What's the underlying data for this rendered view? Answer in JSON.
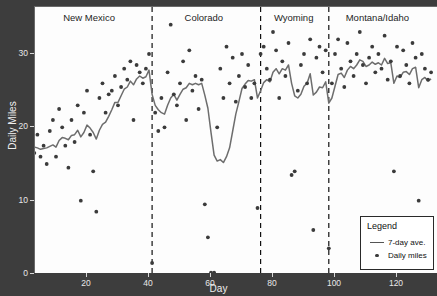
{
  "chart_data": {
    "type": "scatter",
    "title": "",
    "xlabel": "Day",
    "ylabel": "Daily Miles",
    "xlim": [
      1,
      131
    ],
    "ylim": [
      -1,
      35
    ],
    "xticks": [
      20,
      40,
      60,
      80,
      100,
      120
    ],
    "yticks": [
      0,
      10,
      20,
      30
    ],
    "grid": false,
    "legend": {
      "title": "Legend",
      "position": "bottom-right",
      "entries": [
        {
          "label": "7-day ave.",
          "symbol": "line",
          "color": "#555555"
        },
        {
          "label": "Daily miles",
          "symbol": "dot",
          "color": "#3b3b3b"
        }
      ]
    },
    "regions": [
      {
        "label": "New Mexico",
        "start": 1,
        "end": 41,
        "center_day": 21
      },
      {
        "label": "Colorado",
        "start": 41,
        "end": 76,
        "center_day": 58
      },
      {
        "label": "Wyoming",
        "start": 76,
        "end": 98,
        "center_day": 87
      },
      {
        "label": "Montana/Idaho",
        "start": 98,
        "end": 131,
        "center_day": 114
      }
    ],
    "region_dividers": [
      41,
      76,
      98
    ],
    "series": [
      {
        "name": "Daily miles",
        "type": "scatter",
        "color": "#3b3b3b",
        "x": [
          1,
          2,
          3,
          4,
          5,
          6,
          7,
          8,
          9,
          10,
          11,
          12,
          13,
          14,
          15,
          16,
          17,
          18,
          19,
          20,
          21,
          22,
          23,
          24,
          25,
          26,
          27,
          28,
          29,
          30,
          31,
          32,
          33,
          34,
          35,
          36,
          37,
          38,
          39,
          40,
          41,
          42,
          43,
          44,
          45,
          46,
          47,
          48,
          49,
          50,
          51,
          52,
          53,
          54,
          55,
          56,
          57,
          58,
          59,
          60,
          61,
          62,
          63,
          64,
          65,
          66,
          67,
          68,
          69,
          70,
          71,
          72,
          73,
          74,
          75,
          76,
          77,
          78,
          79,
          80,
          81,
          82,
          83,
          84,
          85,
          86,
          87,
          88,
          89,
          90,
          91,
          92,
          93,
          94,
          95,
          96,
          97,
          98,
          99,
          100,
          101,
          102,
          103,
          104,
          105,
          106,
          107,
          108,
          109,
          110,
          111,
          112,
          113,
          114,
          115,
          116,
          117,
          118,
          119,
          120,
          121,
          122,
          123,
          124,
          125,
          126,
          127,
          128,
          129,
          130,
          131
        ],
        "y": [
          18.5,
          17.0,
          16.5,
          19.0,
          16.0,
          17.5,
          15.0,
          19.5,
          21.0,
          16.0,
          22.5,
          20.0,
          17.5,
          14.5,
          21.0,
          18.0,
          23.0,
          10.0,
          22.0,
          25.0,
          19.0,
          14.0,
          8.5,
          24.0,
          26.0,
          22.0,
          24.5,
          25.0,
          27.0,
          23.0,
          25.5,
          28.0,
          26.5,
          29.0,
          21.0,
          28.5,
          27.5,
          26.0,
          28.0,
          30.0,
          1.5,
          22.0,
          19.5,
          24.0,
          20.0,
          27.5,
          34.0,
          24.5,
          23.0,
          26.0,
          29.0,
          21.0,
          30.5,
          25.0,
          27.0,
          22.5,
          26.5,
          9.5,
          5.0,
          0.2,
          0.2,
          20.0,
          28.0,
          24.0,
          31.0,
          26.0,
          29.5,
          23.5,
          27.0,
          30.0,
          25.5,
          28.5,
          24.0,
          26.0,
          9.0,
          30.0,
          31.0,
          28.0,
          26.5,
          33.0,
          30.5,
          24.0,
          29.0,
          27.0,
          31.5,
          13.5,
          14.0,
          25.0,
          28.5,
          30.0,
          26.0,
          32.0,
          6.0,
          29.5,
          31.0,
          27.5,
          30.5,
          3.5,
          26.0,
          30.0,
          32.0,
          28.0,
          25.5,
          31.5,
          29.0,
          27.0,
          30.0,
          33.0,
          28.5,
          26.0,
          29.5,
          31.0,
          27.5,
          30.0,
          28.0,
          32.5,
          26.5,
          29.0,
          14.0,
          31.0,
          27.0,
          30.5,
          28.5,
          26.0,
          31.5,
          29.5,
          10.0,
          30.0,
          28.0,
          26.5,
          27.5
        ]
      },
      {
        "name": "7-day ave.",
        "type": "line",
        "color": "#6d6d6d",
        "x": [
          1,
          2,
          3,
          4,
          5,
          6,
          7,
          8,
          9,
          10,
          11,
          12,
          13,
          14,
          15,
          16,
          17,
          18,
          19,
          20,
          21,
          22,
          23,
          24,
          25,
          26,
          27,
          28,
          29,
          30,
          31,
          32,
          33,
          34,
          35,
          36,
          37,
          38,
          39,
          40,
          41,
          42,
          43,
          44,
          45,
          46,
          47,
          48,
          49,
          50,
          51,
          52,
          53,
          54,
          55,
          56,
          57,
          58,
          59,
          60,
          61,
          62,
          63,
          64,
          65,
          66,
          67,
          68,
          69,
          70,
          71,
          72,
          73,
          74,
          75,
          76,
          77,
          78,
          79,
          80,
          81,
          82,
          83,
          84,
          85,
          86,
          87,
          88,
          89,
          90,
          91,
          92,
          93,
          94,
          95,
          96,
          97,
          98,
          99,
          100,
          101,
          102,
          103,
          104,
          105,
          106,
          107,
          108,
          109,
          110,
          111,
          112,
          113,
          114,
          115,
          116,
          117,
          118,
          119,
          120,
          121,
          122,
          123,
          124,
          125,
          126,
          127,
          128,
          129,
          130,
          131
        ],
        "y": [
          17.8,
          17.6,
          17.3,
          17.2,
          17.0,
          17.1,
          17.2,
          17.4,
          17.6,
          17.3,
          18.2,
          18.6,
          18.5,
          18.3,
          18.9,
          19.0,
          19.6,
          18.7,
          19.3,
          20.3,
          19.9,
          19.3,
          18.4,
          19.6,
          20.4,
          20.7,
          21.5,
          22.4,
          23.4,
          23.4,
          24.3,
          25.2,
          25.5,
          26.3,
          25.8,
          26.6,
          27.0,
          26.7,
          26.9,
          27.8,
          24.5,
          23.0,
          22.4,
          22.0,
          21.8,
          23.0,
          24.0,
          24.5,
          23.7,
          24.5,
          25.2,
          25.4,
          26.0,
          25.8,
          26.0,
          25.8,
          26.0,
          24.4,
          22.6,
          19.3,
          16.2,
          15.4,
          15.6,
          15.2,
          16.0,
          17.2,
          19.5,
          21.8,
          23.5,
          25.3,
          25.9,
          26.4,
          26.3,
          26.5,
          24.0,
          25.0,
          26.1,
          26.5,
          26.2,
          27.5,
          28.0,
          27.3,
          28.0,
          27.8,
          28.5,
          26.0,
          24.3,
          24.0,
          24.5,
          25.6,
          26.0,
          27.3,
          24.4,
          24.8,
          25.5,
          25.4,
          26.2,
          23.3,
          24.0,
          25.6,
          27.2,
          27.4,
          26.8,
          27.8,
          28.3,
          28.0,
          28.5,
          29.2,
          29.0,
          28.3,
          28.5,
          28.9,
          28.6,
          28.8,
          28.5,
          29.4,
          28.7,
          28.8,
          26.0,
          27.0,
          26.8,
          27.5,
          27.6,
          27.2,
          28.0,
          28.2,
          25.4,
          26.5,
          26.8,
          26.3,
          26.6
        ]
      }
    ]
  }
}
